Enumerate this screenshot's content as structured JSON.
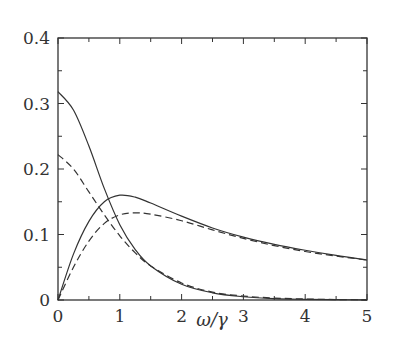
{
  "chart_data": {
    "type": "line",
    "title": "",
    "xlabel": "ω/γ",
    "ylabel": "",
    "xlim": [
      0,
      5
    ],
    "ylim": [
      0,
      0.4
    ],
    "grid": false,
    "legend": null,
    "x_ticks": [
      "0",
      "1",
      "2",
      "3",
      "4",
      "5"
    ],
    "y_ticks": [
      "0",
      "0.1",
      "0.2",
      "0.3",
      "0.4"
    ],
    "x": [
      0,
      0.25,
      0.5,
      0.75,
      1.0,
      1.25,
      1.5,
      2.0,
      2.5,
      3.0,
      3.5,
      4.0,
      4.5,
      5.0
    ],
    "series": [
      {
        "name": "decaying-solid",
        "style": "solid",
        "values": [
          0.318,
          0.29,
          0.235,
          0.17,
          0.115,
          0.077,
          0.052,
          0.024,
          0.011,
          0.005,
          0.002,
          0.001,
          0.0005,
          0.0002
        ]
      },
      {
        "name": "decaying-dashed",
        "style": "dashed",
        "values": [
          0.222,
          0.2,
          0.165,
          0.13,
          0.098,
          0.072,
          0.052,
          0.026,
          0.012,
          0.006,
          0.003,
          0.0015,
          0.0007,
          0.0003
        ]
      },
      {
        "name": "rising-solid",
        "style": "solid",
        "values": [
          0.0,
          0.07,
          0.12,
          0.15,
          0.16,
          0.157,
          0.148,
          0.128,
          0.11,
          0.096,
          0.085,
          0.076,
          0.068,
          0.061
        ]
      },
      {
        "name": "rising-dashed",
        "style": "dashed",
        "values": [
          0.0,
          0.05,
          0.09,
          0.117,
          0.13,
          0.133,
          0.131,
          0.121,
          0.107,
          0.094,
          0.083,
          0.074,
          0.067,
          0.061
        ]
      }
    ]
  },
  "colors": {
    "line": "#333333",
    "frame": "#333333"
  }
}
